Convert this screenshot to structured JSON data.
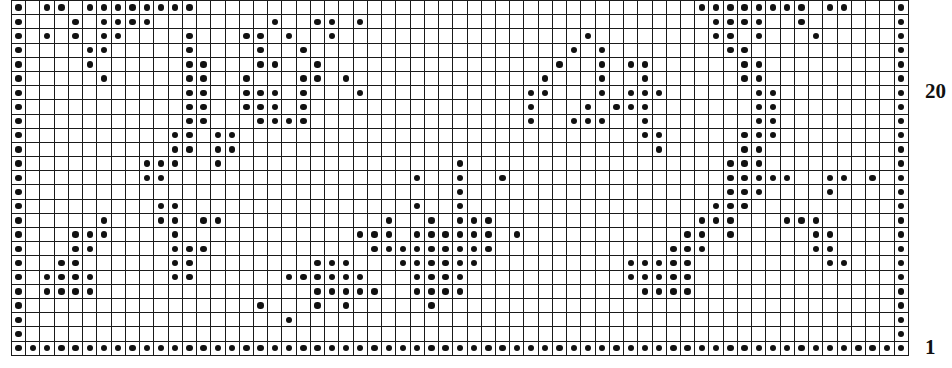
{
  "chart": {
    "title": "",
    "type": "grid-pattern-chart",
    "columns": 63,
    "rows": 25,
    "cell_symbol": "filled-dot",
    "grid_color": "#1a1a1a",
    "dot_color": "#111111",
    "background_color": "#ffffff"
  },
  "labels": {
    "row_20": "20",
    "row_1": "1"
  },
  "chart_data": {
    "type": "heatmap",
    "title": "",
    "xlabel": "",
    "ylabel": "",
    "grid": true,
    "legend_position": "none",
    "columns": 63,
    "rows": 25,
    "row_labels": [
      "20",
      "1"
    ],
    "row_label_positions": [
      6,
      24
    ],
    "value_meaning": {
      "1": "filled dot",
      "0": "empty cell"
    },
    "matrix": [
      [
        1,
        0,
        1,
        1,
        0,
        1,
        1,
        1,
        1,
        1,
        1,
        1,
        1,
        0,
        0,
        0,
        0,
        0,
        0,
        0,
        0,
        0,
        0,
        0,
        0,
        0,
        0,
        0,
        0,
        0,
        0,
        0,
        0,
        0,
        0,
        0,
        0,
        0,
        0,
        0,
        0,
        0,
        0,
        0,
        0,
        0,
        0,
        0,
        1,
        1,
        1,
        1,
        1,
        1,
        1,
        1,
        0,
        1,
        1,
        0,
        0,
        0,
        1
      ],
      [
        1,
        0,
        0,
        0,
        1,
        0,
        1,
        1,
        1,
        1,
        0,
        0,
        0,
        0,
        0,
        0,
        0,
        0,
        1,
        0,
        0,
        1,
        1,
        0,
        1,
        0,
        0,
        0,
        0,
        0,
        0,
        0,
        0,
        0,
        0,
        0,
        0,
        0,
        0,
        0,
        0,
        0,
        0,
        0,
        0,
        0,
        0,
        0,
        0,
        1,
        1,
        1,
        1,
        0,
        0,
        1,
        0,
        0,
        0,
        0,
        0,
        0,
        1
      ],
      [
        1,
        0,
        1,
        0,
        1,
        0,
        1,
        1,
        0,
        0,
        0,
        0,
        1,
        0,
        0,
        0,
        1,
        1,
        0,
        1,
        0,
        0,
        1,
        0,
        0,
        0,
        0,
        0,
        0,
        0,
        0,
        0,
        0,
        0,
        0,
        0,
        0,
        0,
        0,
        0,
        1,
        0,
        0,
        0,
        0,
        0,
        0,
        0,
        0,
        1,
        1,
        0,
        1,
        0,
        0,
        0,
        1,
        0,
        0,
        0,
        0,
        0,
        1
      ],
      [
        1,
        0,
        0,
        0,
        0,
        1,
        1,
        0,
        0,
        0,
        0,
        0,
        1,
        0,
        0,
        0,
        0,
        1,
        0,
        0,
        1,
        0,
        0,
        0,
        0,
        0,
        0,
        0,
        0,
        0,
        0,
        0,
        0,
        0,
        0,
        0,
        0,
        0,
        0,
        1,
        0,
        1,
        0,
        0,
        0,
        0,
        0,
        0,
        0,
        0,
        1,
        1,
        0,
        0,
        0,
        0,
        0,
        0,
        0,
        0,
        0,
        0,
        1
      ],
      [
        1,
        0,
        0,
        0,
        0,
        1,
        0,
        0,
        0,
        0,
        0,
        0,
        1,
        1,
        0,
        0,
        0,
        1,
        1,
        0,
        0,
        1,
        0,
        0,
        0,
        0,
        0,
        0,
        0,
        0,
        0,
        0,
        0,
        0,
        0,
        0,
        0,
        0,
        1,
        0,
        0,
        1,
        0,
        1,
        1,
        0,
        0,
        0,
        0,
        0,
        0,
        1,
        1,
        0,
        0,
        0,
        0,
        0,
        0,
        0,
        0,
        0,
        1
      ],
      [
        1,
        0,
        0,
        0,
        0,
        0,
        1,
        0,
        0,
        0,
        0,
        0,
        1,
        1,
        0,
        0,
        1,
        0,
        0,
        0,
        1,
        1,
        0,
        1,
        0,
        0,
        0,
        0,
        0,
        0,
        0,
        0,
        0,
        0,
        0,
        0,
        0,
        1,
        0,
        0,
        0,
        1,
        0,
        0,
        1,
        0,
        0,
        0,
        0,
        0,
        0,
        1,
        1,
        0,
        0,
        0,
        0,
        0,
        0,
        0,
        0,
        0,
        1
      ],
      [
        1,
        0,
        0,
        0,
        0,
        0,
        0,
        0,
        0,
        0,
        0,
        0,
        1,
        1,
        0,
        0,
        1,
        1,
        1,
        0,
        1,
        0,
        0,
        0,
        1,
        0,
        0,
        0,
        0,
        0,
        0,
        0,
        0,
        0,
        0,
        0,
        1,
        1,
        0,
        0,
        0,
        1,
        0,
        1,
        1,
        1,
        0,
        0,
        0,
        0,
        0,
        0,
        1,
        1,
        0,
        0,
        0,
        0,
        0,
        0,
        0,
        0,
        1
      ],
      [
        1,
        0,
        0,
        0,
        0,
        0,
        0,
        0,
        0,
        0,
        0,
        0,
        1,
        1,
        0,
        0,
        1,
        1,
        1,
        0,
        1,
        0,
        0,
        0,
        0,
        0,
        0,
        0,
        0,
        0,
        0,
        0,
        0,
        0,
        0,
        0,
        1,
        0,
        0,
        0,
        1,
        0,
        1,
        1,
        1,
        0,
        0,
        0,
        0,
        0,
        0,
        0,
        1,
        1,
        0,
        0,
        0,
        0,
        0,
        0,
        0,
        0,
        1
      ],
      [
        1,
        0,
        0,
        0,
        0,
        0,
        0,
        0,
        0,
        0,
        0,
        0,
        1,
        1,
        0,
        0,
        0,
        1,
        1,
        1,
        1,
        0,
        0,
        0,
        0,
        0,
        0,
        0,
        0,
        0,
        0,
        0,
        0,
        0,
        0,
        0,
        1,
        0,
        0,
        1,
        1,
        1,
        0,
        0,
        1,
        0,
        0,
        0,
        0,
        0,
        0,
        0,
        1,
        1,
        0,
        0,
        0,
        0,
        0,
        0,
        0,
        0,
        1
      ],
      [
        1,
        0,
        0,
        0,
        0,
        0,
        0,
        0,
        0,
        0,
        0,
        1,
        1,
        0,
        1,
        1,
        0,
        0,
        0,
        0,
        0,
        0,
        0,
        0,
        0,
        0,
        0,
        0,
        0,
        0,
        0,
        0,
        0,
        0,
        0,
        0,
        0,
        0,
        0,
        0,
        0,
        0,
        0,
        0,
        1,
        1,
        0,
        0,
        0,
        0,
        0,
        1,
        1,
        1,
        0,
        0,
        0,
        0,
        0,
        0,
        0,
        0,
        1
      ],
      [
        1,
        0,
        0,
        0,
        0,
        0,
        0,
        0,
        0,
        0,
        0,
        1,
        1,
        0,
        1,
        1,
        0,
        0,
        0,
        0,
        0,
        0,
        0,
        0,
        0,
        0,
        0,
        0,
        0,
        0,
        0,
        0,
        0,
        0,
        0,
        0,
        0,
        0,
        0,
        0,
        0,
        0,
        0,
        0,
        0,
        1,
        0,
        0,
        0,
        0,
        0,
        1,
        1,
        0,
        0,
        0,
        0,
        0,
        0,
        0,
        0,
        0,
        1
      ],
      [
        1,
        0,
        0,
        0,
        0,
        0,
        0,
        0,
        0,
        1,
        1,
        1,
        0,
        0,
        1,
        0,
        0,
        0,
        0,
        0,
        0,
        0,
        0,
        0,
        0,
        0,
        0,
        0,
        0,
        0,
        0,
        1,
        0,
        0,
        0,
        0,
        0,
        0,
        0,
        0,
        0,
        0,
        0,
        0,
        0,
        0,
        0,
        0,
        0,
        0,
        1,
        1,
        1,
        0,
        0,
        0,
        0,
        0,
        0,
        0,
        0,
        0,
        1
      ],
      [
        1,
        0,
        0,
        0,
        0,
        0,
        0,
        0,
        0,
        1,
        1,
        0,
        0,
        0,
        0,
        0,
        0,
        0,
        0,
        0,
        0,
        0,
        0,
        0,
        0,
        0,
        0,
        0,
        1,
        0,
        0,
        1,
        0,
        0,
        1,
        0,
        0,
        0,
        0,
        0,
        0,
        0,
        0,
        0,
        0,
        0,
        0,
        0,
        0,
        0,
        1,
        1,
        1,
        1,
        1,
        0,
        0,
        1,
        1,
        0,
        1,
        0,
        1
      ],
      [
        1,
        0,
        0,
        0,
        0,
        0,
        0,
        0,
        0,
        0,
        0,
        0,
        0,
        0,
        0,
        0,
        0,
        0,
        0,
        0,
        0,
        0,
        0,
        0,
        0,
        0,
        0,
        0,
        0,
        0,
        0,
        1,
        0,
        0,
        0,
        0,
        0,
        0,
        0,
        0,
        0,
        0,
        0,
        0,
        0,
        0,
        0,
        0,
        0,
        0,
        1,
        1,
        1,
        0,
        0,
        0,
        0,
        1,
        0,
        0,
        0,
        0,
        1
      ],
      [
        1,
        0,
        0,
        0,
        0,
        0,
        0,
        0,
        0,
        0,
        1,
        1,
        0,
        0,
        0,
        0,
        0,
        0,
        0,
        0,
        0,
        0,
        0,
        0,
        0,
        0,
        0,
        0,
        1,
        0,
        0,
        1,
        0,
        0,
        0,
        0,
        0,
        0,
        0,
        0,
        0,
        0,
        0,
        0,
        0,
        0,
        0,
        0,
        0,
        1,
        1,
        1,
        0,
        0,
        0,
        0,
        0,
        0,
        0,
        0,
        0,
        0,
        1
      ],
      [
        1,
        0,
        0,
        0,
        0,
        0,
        1,
        0,
        0,
        0,
        1,
        1,
        0,
        1,
        1,
        0,
        0,
        0,
        0,
        0,
        0,
        0,
        0,
        0,
        0,
        0,
        1,
        0,
        0,
        1,
        0,
        1,
        1,
        1,
        0,
        0,
        0,
        0,
        0,
        0,
        0,
        0,
        0,
        0,
        0,
        0,
        0,
        0,
        1,
        1,
        1,
        0,
        0,
        0,
        1,
        1,
        1,
        0,
        0,
        0,
        0,
        0,
        1
      ],
      [
        1,
        0,
        0,
        0,
        1,
        1,
        1,
        0,
        0,
        0,
        0,
        1,
        0,
        0,
        0,
        0,
        0,
        0,
        0,
        0,
        0,
        0,
        0,
        0,
        1,
        1,
        1,
        0,
        1,
        1,
        1,
        1,
        1,
        1,
        0,
        1,
        0,
        0,
        0,
        0,
        0,
        0,
        0,
        0,
        0,
        0,
        0,
        1,
        1,
        0,
        1,
        0,
        0,
        0,
        0,
        0,
        1,
        1,
        0,
        0,
        0,
        0,
        1
      ],
      [
        1,
        0,
        0,
        0,
        1,
        1,
        0,
        0,
        0,
        0,
        0,
        1,
        1,
        1,
        0,
        0,
        0,
        0,
        0,
        0,
        0,
        0,
        0,
        0,
        0,
        1,
        1,
        1,
        1,
        1,
        1,
        1,
        1,
        1,
        0,
        0,
        0,
        0,
        0,
        0,
        0,
        0,
        0,
        0,
        0,
        0,
        1,
        1,
        1,
        0,
        0,
        0,
        0,
        0,
        0,
        0,
        1,
        1,
        0,
        0,
        0,
        0,
        1
      ],
      [
        1,
        0,
        0,
        1,
        1,
        0,
        0,
        0,
        0,
        0,
        0,
        1,
        1,
        0,
        0,
        0,
        0,
        0,
        0,
        0,
        0,
        1,
        1,
        1,
        0,
        0,
        0,
        1,
        1,
        1,
        1,
        1,
        1,
        0,
        0,
        0,
        0,
        0,
        0,
        0,
        0,
        0,
        0,
        1,
        1,
        1,
        1,
        1,
        0,
        0,
        0,
        0,
        0,
        0,
        0,
        0,
        0,
        1,
        1,
        0,
        0,
        0,
        1
      ],
      [
        1,
        0,
        1,
        1,
        1,
        1,
        0,
        0,
        0,
        0,
        0,
        1,
        1,
        0,
        0,
        0,
        0,
        0,
        0,
        1,
        1,
        1,
        1,
        1,
        1,
        0,
        0,
        0,
        1,
        1,
        1,
        1,
        0,
        0,
        0,
        0,
        0,
        0,
        0,
        0,
        0,
        0,
        0,
        1,
        1,
        1,
        1,
        1,
        0,
        0,
        0,
        0,
        0,
        0,
        0,
        0,
        0,
        0,
        0,
        0,
        0,
        0,
        1
      ],
      [
        1,
        0,
        1,
        1,
        1,
        1,
        0,
        0,
        0,
        0,
        0,
        0,
        0,
        0,
        0,
        0,
        0,
        0,
        0,
        0,
        0,
        1,
        1,
        1,
        1,
        1,
        0,
        0,
        1,
        1,
        1,
        1,
        0,
        0,
        0,
        0,
        0,
        0,
        0,
        0,
        0,
        0,
        0,
        0,
        1,
        1,
        1,
        1,
        0,
        0,
        0,
        0,
        0,
        0,
        0,
        0,
        0,
        0,
        0,
        0,
        0,
        0,
        1
      ],
      [
        1,
        0,
        0,
        0,
        0,
        0,
        0,
        0,
        0,
        0,
        0,
        0,
        0,
        0,
        0,
        0,
        0,
        1,
        0,
        0,
        0,
        1,
        0,
        1,
        0,
        0,
        0,
        0,
        0,
        1,
        0,
        0,
        0,
        0,
        0,
        0,
        0,
        0,
        0,
        0,
        0,
        0,
        0,
        0,
        0,
        0,
        0,
        0,
        0,
        0,
        0,
        0,
        0,
        0,
        0,
        0,
        0,
        0,
        0,
        0,
        0,
        0,
        1
      ],
      [
        1,
        0,
        0,
        0,
        0,
        0,
        0,
        0,
        0,
        0,
        0,
        0,
        0,
        0,
        0,
        0,
        0,
        0,
        0,
        1,
        0,
        0,
        0,
        0,
        0,
        0,
        0,
        0,
        0,
        0,
        0,
        0,
        0,
        0,
        0,
        0,
        0,
        0,
        0,
        0,
        0,
        0,
        0,
        0,
        0,
        0,
        0,
        0,
        0,
        0,
        0,
        0,
        0,
        0,
        0,
        0,
        0,
        0,
        0,
        0,
        0,
        0,
        1
      ],
      [
        1,
        0,
        0,
        0,
        0,
        0,
        0,
        0,
        0,
        0,
        0,
        0,
        0,
        0,
        0,
        0,
        0,
        0,
        0,
        0,
        0,
        0,
        0,
        0,
        0,
        0,
        0,
        0,
        0,
        0,
        0,
        0,
        0,
        0,
        0,
        0,
        0,
        0,
        0,
        0,
        0,
        0,
        0,
        0,
        0,
        0,
        0,
        0,
        0,
        0,
        0,
        0,
        0,
        0,
        0,
        0,
        0,
        0,
        0,
        0,
        0,
        0,
        1
      ],
      [
        1,
        1,
        1,
        1,
        1,
        1,
        1,
        1,
        1,
        1,
        1,
        1,
        1,
        1,
        1,
        1,
        1,
        1,
        1,
        1,
        1,
        1,
        1,
        1,
        1,
        1,
        1,
        1,
        1,
        1,
        1,
        1,
        1,
        1,
        1,
        1,
        1,
        1,
        1,
        1,
        1,
        1,
        1,
        1,
        1,
        1,
        1,
        1,
        1,
        1,
        1,
        1,
        1,
        1,
        1,
        1,
        1,
        1,
        1,
        1,
        1,
        1,
        1
      ]
    ]
  }
}
